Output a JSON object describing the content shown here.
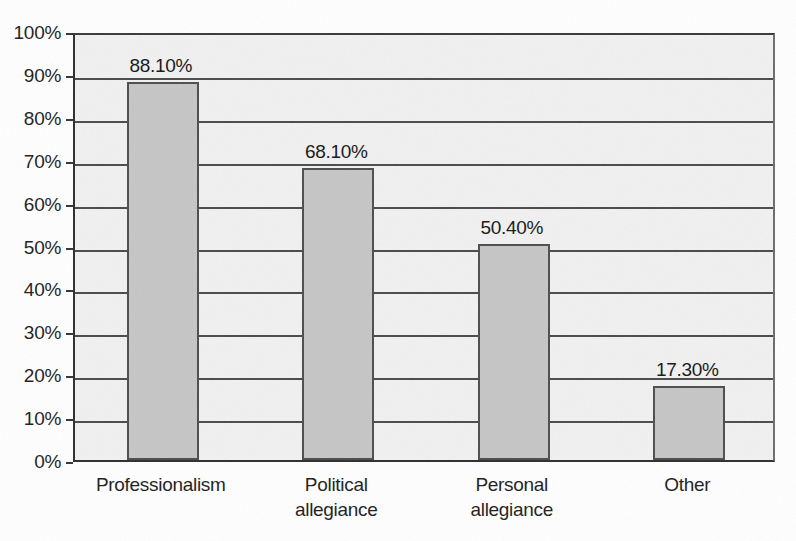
{
  "chart_data": {
    "type": "bar",
    "title": "",
    "xlabel": "",
    "ylabel": "",
    "categories": [
      "Professionalism",
      "Political\nallegiance",
      "Personal\nallegiance",
      "Other"
    ],
    "values": [
      88.1,
      68.1,
      50.4,
      17.3
    ],
    "value_labels": [
      "88.10%",
      "68.10%",
      "50.40%",
      "17.30%"
    ],
    "ylim": [
      0,
      100
    ],
    "ytick_labels": [
      "100%",
      "90%",
      "80%",
      "70%",
      "60%",
      "50%",
      "40%",
      "30%",
      "20%",
      "10%",
      "0%"
    ],
    "ytick_values": [
      100,
      90,
      80,
      70,
      60,
      50,
      40,
      30,
      20,
      10,
      0
    ],
    "grid": true,
    "legend": false,
    "legend_position": "none",
    "colors": {
      "bar_fill": "#c6c6c6",
      "bar_border": "#4d4d4d",
      "plot_background": "#f1f1f1",
      "gridline": "#4a4a4a",
      "axis": "#2e2e2e",
      "text": "#1d1d1d",
      "page_background": "#ffffff"
    }
  }
}
